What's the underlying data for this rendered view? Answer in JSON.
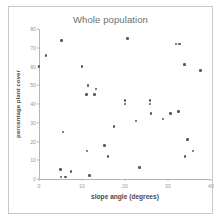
{
  "chart_data": {
    "type": "scatter",
    "title": "Whole population",
    "xlabel": "slope angle (degrees)",
    "ylabel": "percentage plant cover",
    "xlim": [
      0,
      40
    ],
    "ylim": [
      0,
      80
    ],
    "xticks": [
      "0",
      "10",
      "20",
      "30",
      "40"
    ],
    "xtick_values": [
      0,
      10,
      20,
      30,
      40
    ],
    "yticks": [
      "0",
      "10",
      "20",
      "30",
      "40",
      "50",
      "60",
      "70",
      "80"
    ],
    "ytick_values": [
      0,
      10,
      20,
      30,
      40,
      50,
      60,
      70,
      80
    ],
    "grid": false,
    "legend": null,
    "marker_color": "#59595e",
    "points": [
      {
        "x": 0.0,
        "y": 60
      },
      {
        "x": 1.6,
        "y": 66
      },
      {
        "x": 5.3,
        "y": 74
      },
      {
        "x": 5.0,
        "y": 5
      },
      {
        "x": 5.1,
        "y": 1
      },
      {
        "x": 6.2,
        "y": 1
      },
      {
        "x": 5.6,
        "y": 25
      },
      {
        "x": 7.4,
        "y": 4
      },
      {
        "x": 10.0,
        "y": 60
      },
      {
        "x": 11.4,
        "y": 50
      },
      {
        "x": 11.0,
        "y": 45
      },
      {
        "x": 11.2,
        "y": 15
      },
      {
        "x": 11.8,
        "y": 2
      },
      {
        "x": 13.3,
        "y": 48
      },
      {
        "x": 12.9,
        "y": 45
      },
      {
        "x": 15.2,
        "y": 18
      },
      {
        "x": 16.0,
        "y": 12
      },
      {
        "x": 17.4,
        "y": 28
      },
      {
        "x": 20.0,
        "y": 42
      },
      {
        "x": 20.0,
        "y": 40
      },
      {
        "x": 20.6,
        "y": 75
      },
      {
        "x": 22.6,
        "y": 31
      },
      {
        "x": 23.4,
        "y": 6
      },
      {
        "x": 25.8,
        "y": 42
      },
      {
        "x": 25.8,
        "y": 40
      },
      {
        "x": 26.0,
        "y": 35
      },
      {
        "x": 28.8,
        "y": 32
      },
      {
        "x": 30.6,
        "y": 35
      },
      {
        "x": 31.9,
        "y": 72
      },
      {
        "x": 32.7,
        "y": 72
      },
      {
        "x": 32.4,
        "y": 36
      },
      {
        "x": 33.8,
        "y": 61
      },
      {
        "x": 34.0,
        "y": 12
      },
      {
        "x": 34.6,
        "y": 21
      },
      {
        "x": 35.8,
        "y": 15
      },
      {
        "x": 37.6,
        "y": 58
      }
    ]
  }
}
